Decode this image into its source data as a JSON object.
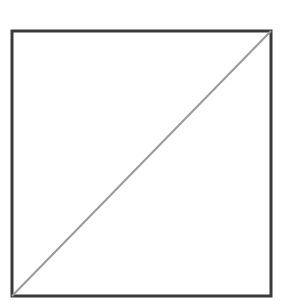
{
  "diagram": {
    "shape": "square-with-diagonal",
    "square": {
      "x": 12,
      "y": 31,
      "width": 259,
      "height": 265,
      "stroke": "#3a3a3a",
      "stroke_width": 3
    },
    "diagonal": {
      "x1": 12,
      "y1": 296,
      "x2": 271,
      "y2": 31,
      "stroke": "#9a9a9a",
      "stroke_width": 2
    }
  }
}
